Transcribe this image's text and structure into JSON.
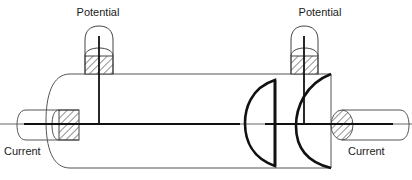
{
  "diagram": {
    "kind": "four-point-probe-resistivity-schematic",
    "background_color": "#ffffff",
    "line_color": "#1a1a1a",
    "thin_line_color": "#555555",
    "hatch_color": "#333333",
    "labels": {
      "potential_left": "Potential",
      "potential_right": "Potential",
      "current_left": "Current",
      "current_right": "Current"
    },
    "label_positions": {
      "potential_left": {
        "x": 98,
        "y": 16,
        "anchor": "middle"
      },
      "potential_right": {
        "x": 320,
        "y": 16,
        "anchor": "middle"
      },
      "current_left": {
        "x": 4,
        "y": 155,
        "anchor": "start"
      },
      "current_right": {
        "x": 348,
        "y": 155,
        "anchor": "start"
      }
    },
    "body": {
      "name": "specimen-cylinder",
      "top_y": 74,
      "bottom_y": 168,
      "left_x": 70,
      "right_x": 331,
      "cap_bulge": 24,
      "axis_y": 124
    },
    "potential_probes": [
      {
        "name": "potential-probe-left",
        "center_x": 99,
        "tube_left": 85,
        "tube_right": 113,
        "tube_top": 26,
        "tube_bottom": 74,
        "dome_radius": 14,
        "block_top": 56,
        "block_bottom": 74,
        "stem_top": 36,
        "stem_bottom": 124
      },
      {
        "name": "potential-probe-right",
        "center_x": 304,
        "tube_left": 291,
        "tube_right": 318,
        "tube_top": 26,
        "tube_bottom": 74,
        "dome_radius": 13.5,
        "block_top": 56,
        "block_bottom": 74,
        "stem_top": 36,
        "stem_bottom": 124
      }
    ],
    "current_electrodes": [
      {
        "name": "current-electrode-left",
        "rod_left": 17,
        "rod_right": 59,
        "rod_top": 110,
        "rod_bottom": 140,
        "cap_bulge": 9,
        "block_left": 59,
        "block_right": 79,
        "block_top": 110,
        "block_bottom": 140,
        "lead_left": 24,
        "lead_right": 240,
        "axis_y": 124
      },
      {
        "name": "current-electrode-right",
        "rod_left": 353,
        "rod_right": 400,
        "rod_top": 110,
        "rod_bottom": 140,
        "cap_bulge": 9,
        "block_left": 331,
        "block_right": 353,
        "block_top": 110,
        "block_bottom": 140,
        "lead_left": 265,
        "lead_right": 393,
        "axis_y": 124
      }
    ],
    "internal_features": [
      {
        "name": "equipotential-lens",
        "type": "closed-lens",
        "edge_x": 275,
        "top_y": 80,
        "bottom_y": 166,
        "bulge": 30,
        "stroke_width": 2.6
      },
      {
        "name": "far-end-cap-arc",
        "type": "open-arc",
        "edge_x": 331,
        "top_y": 74,
        "bottom_y": 168,
        "bulge": 36,
        "stroke_width": 2.6
      }
    ],
    "axis_line": {
      "name": "measurement-axis",
      "x1": 0,
      "x2": 412,
      "y": 124
    }
  }
}
